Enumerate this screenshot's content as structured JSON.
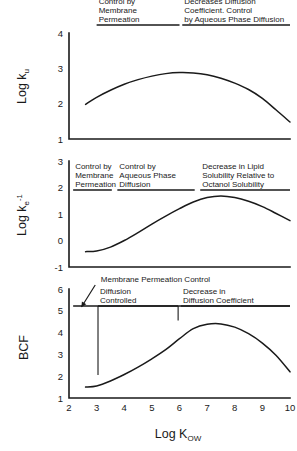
{
  "figure": {
    "background": "#ffffff",
    "ink": "#1a1a1a",
    "xaxis": {
      "title_main": "Log K",
      "title_sub": "OW",
      "ticks": [
        "2",
        "3",
        "4",
        "5",
        "6",
        "7",
        "8",
        "9",
        "10"
      ],
      "min": 2,
      "max": 10
    }
  },
  "chart_data": [
    {
      "type": "line",
      "panel": "top",
      "title": "",
      "ylabel": "Log k_u",
      "ylabel_main": "Log k",
      "ylabel_sub": "u",
      "xlabel": "Log K_OW",
      "ylim": [
        1,
        4
      ],
      "xlim": [
        2,
        10
      ],
      "yticks": [
        "1",
        "2",
        "3",
        "4"
      ],
      "grid": false,
      "x": [
        2.6,
        3.0,
        3.5,
        4.0,
        4.5,
        5.0,
        5.5,
        6.0,
        6.5,
        7.0,
        7.5,
        8.0,
        8.5,
        9.0,
        9.5,
        10.0
      ],
      "values": [
        1.98,
        2.18,
        2.38,
        2.55,
        2.68,
        2.78,
        2.85,
        2.88,
        2.87,
        2.82,
        2.72,
        2.58,
        2.4,
        2.15,
        1.82,
        1.48
      ],
      "annotations": [
        {
          "text_lines": [
            "Control by",
            "Membrane",
            "Permeation"
          ],
          "x_start": 3.0,
          "x_end": 6.0,
          "rule": true
        },
        {
          "text_lines": [
            "Increase in Molecule Size",
            "Decreases Diffusion",
            "Coefficient. Control",
            "by Aqueous Phase Diffusion"
          ],
          "x_start": 6.1,
          "x_end": 10.0,
          "rule": true
        }
      ]
    },
    {
      "type": "line",
      "panel": "middle",
      "title": "",
      "ylabel": "Log k_e^-1",
      "ylabel_main": "Log k",
      "ylabel_sub": "e",
      "ylabel_sup": "-1",
      "xlabel": "Log K_OW",
      "ylim": [
        -1,
        3
      ],
      "xlim": [
        2,
        10
      ],
      "yticks": [
        "-1",
        "0",
        "1",
        "2",
        "3"
      ],
      "grid": false,
      "x": [
        2.6,
        3.0,
        3.5,
        4.0,
        4.5,
        5.0,
        5.5,
        6.0,
        6.5,
        7.0,
        7.5,
        8.0,
        8.5,
        9.0,
        9.5,
        10.0
      ],
      "values": [
        -0.42,
        -0.4,
        -0.25,
        0.0,
        0.3,
        0.62,
        0.92,
        1.2,
        1.45,
        1.62,
        1.68,
        1.62,
        1.48,
        1.28,
        1.02,
        0.75
      ],
      "annotations": [
        {
          "text_lines": [
            "Control by",
            "Membrane",
            "Permeation"
          ],
          "x_start": 2.15,
          "x_end": 3.55,
          "rule": true
        },
        {
          "text_lines": [
            "Control by",
            "Aqueous Phase",
            "Diffusion"
          ],
          "x_start": 3.75,
          "x_end": 6.55,
          "rule": true
        },
        {
          "text_lines": [
            "Decrease in Lipid",
            "Solubility Relative to",
            "Octanol Solubility"
          ],
          "x_start": 6.75,
          "x_end": 10.0,
          "rule": true
        }
      ]
    },
    {
      "type": "line",
      "panel": "bottom",
      "title": "",
      "ylabel": "BCF",
      "xlabel": "Log K_OW",
      "ylim": [
        1,
        6
      ],
      "xlim": [
        2,
        10
      ],
      "yticks": [
        "1",
        "2",
        "3",
        "4",
        "5",
        "6"
      ],
      "grid": false,
      "x": [
        2.6,
        3.0,
        3.5,
        4.0,
        4.5,
        5.0,
        5.5,
        6.0,
        6.5,
        7.0,
        7.5,
        8.0,
        8.5,
        9.0,
        9.5,
        10.0
      ],
      "values": [
        1.5,
        1.55,
        1.78,
        2.08,
        2.42,
        2.8,
        3.22,
        3.72,
        4.18,
        4.38,
        4.4,
        4.25,
        3.95,
        3.52,
        2.95,
        2.2
      ],
      "annotations": [
        {
          "text_lines": [
            "Membrane Permeation Control"
          ],
          "callout": true,
          "arrow_from_x": 2.95,
          "arrow_to_x": 2.45
        },
        {
          "text_lines": [
            "Diffusion",
            "Controlled"
          ],
          "x_start": 3.05,
          "x_end": 5.95,
          "rule": true
        },
        {
          "text_lines": [
            "Decrease in",
            "Diffusion Coefficient"
          ],
          "x_start": 6.05,
          "x_end": 10.0,
          "rule": true
        }
      ],
      "divider_ticks": [
        3.05,
        5.95
      ],
      "baseline_rule": {
        "x_start": 2.15,
        "x_end": 10.0,
        "y": 5.2
      }
    }
  ]
}
